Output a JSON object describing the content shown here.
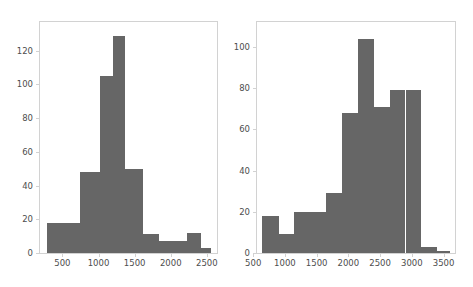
{
  "figure": {
    "background_color": "#ffffff",
    "bar_color": "#666666",
    "frame_color": "#d2d2d2",
    "tick_color": "#4d4d4d"
  },
  "chart_data": [
    {
      "type": "bar",
      "title": "",
      "xlabel": "",
      "ylabel": "",
      "grid": false,
      "legend": null,
      "panel": "left",
      "bin_edges": [
        280,
        740,
        1020,
        1200,
        1370,
        1620,
        1840,
        2040,
        2230,
        2420,
        2560
      ],
      "categories": [
        "280-740",
        "740-1020",
        "1020-1200",
        "1200-1370",
        "1370-1620",
        "1620-1840",
        "1840-2040",
        "2040-2230",
        "2230-2420",
        "2420-2560"
      ],
      "values": [
        18,
        48,
        105,
        129,
        50,
        11,
        7,
        7,
        12,
        3
      ],
      "xlim": [
        190,
        2640
      ],
      "ylim": [
        0,
        137
      ],
      "xticks": [
        500,
        1000,
        1500,
        2000,
        2500
      ],
      "xtick_labels": [
        "500",
        "1000",
        "1500",
        "2000",
        "2500"
      ],
      "yticks": [
        0,
        20,
        40,
        60,
        80,
        100,
        120
      ],
      "ytick_labels": [
        "0",
        "20",
        "40",
        "60",
        "80",
        "100",
        "120"
      ]
    },
    {
      "type": "bar",
      "title": "",
      "xlabel": "",
      "ylabel": "",
      "grid": false,
      "legend": null,
      "panel": "right",
      "bin_edges": [
        640,
        900,
        1150,
        1400,
        1650,
        1900,
        2150,
        2400,
        2650,
        2900,
        3150,
        3400,
        3600
      ],
      "categories": [
        "640-900",
        "900-1150",
        "1150-1400",
        "1400-1650",
        "1650-1900",
        "1900-2150",
        "2150-2400",
        "2400-2650",
        "2650-2900",
        "2900-3150",
        "3150-3400",
        "3400-3600"
      ],
      "values": [
        18,
        9,
        20,
        20,
        29,
        68,
        104,
        71,
        79,
        79,
        3,
        1
      ],
      "xlim": [
        560,
        3680
      ],
      "ylim": [
        0,
        112
      ],
      "xticks": [
        500,
        1000,
        1500,
        2000,
        2500,
        3000,
        3500
      ],
      "xtick_labels": [
        "500",
        "1000",
        "1500",
        "2000",
        "2500",
        "3000",
        "3500"
      ],
      "yticks": [
        0,
        20,
        40,
        60,
        80,
        100
      ],
      "ytick_labels": [
        "0",
        "20",
        "40",
        "60",
        "80",
        "100"
      ]
    }
  ]
}
